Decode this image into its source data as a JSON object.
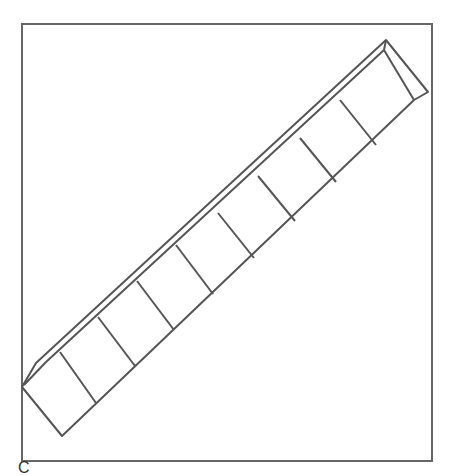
{
  "figure": {
    "segment_count": 8,
    "stroke_color": "#555555",
    "background": "#ffffff"
  },
  "caption": {
    "text": "C"
  }
}
